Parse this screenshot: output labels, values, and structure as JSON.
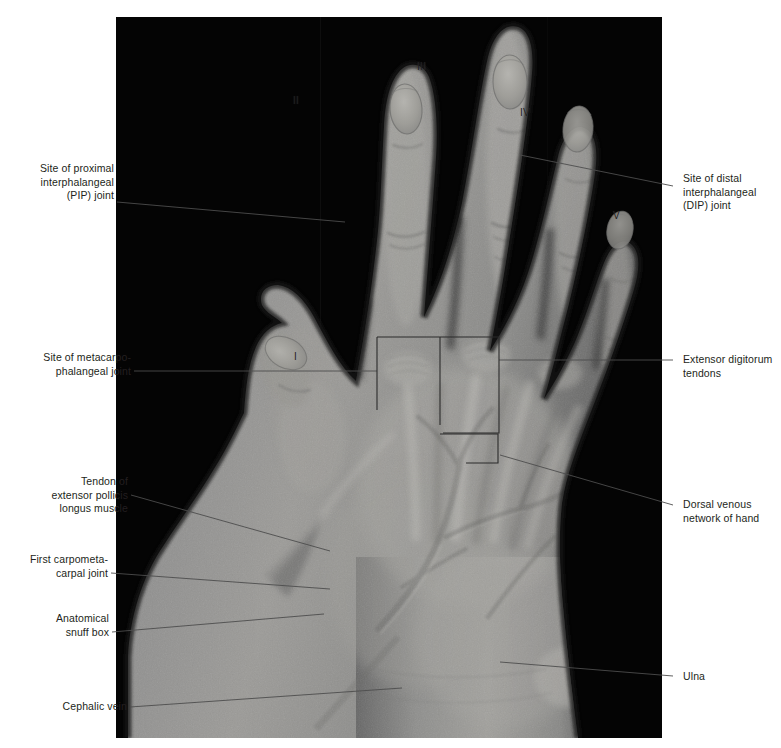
{
  "figure": {
    "background_color": "#ffffff",
    "plate_background_color": "#030303",
    "leader_line_color": "#4d4d4d",
    "label_text_color": "#231f20"
  },
  "labels_left": [
    {
      "name": "pip-joint",
      "text": "Site of proximal\ninterphalangeal\n(PIP) joint"
    },
    {
      "name": "mcp-joint",
      "text": "Site of metacarpo-\nphalangeal joint"
    },
    {
      "name": "epl-tendon",
      "text": "Tendon of\nextensor pollicis\nlongus muscle"
    },
    {
      "name": "first-cmc-joint",
      "text": "First carpometa-\ncarpal joint"
    },
    {
      "name": "snuff-box",
      "text": "Anatomical\nsnuff box"
    },
    {
      "name": "cephalic-vein",
      "text": "Cephalic vein"
    }
  ],
  "labels_right": [
    {
      "name": "dip-joint",
      "text": "Site of distal\ninterphalangeal\n(DIP) joint"
    },
    {
      "name": "extensor-digitorum-tendons",
      "text": "Extensor digitorum\ntendons"
    },
    {
      "name": "dorsal-venous-network",
      "text": "Dorsal venous\nnetwork of hand"
    },
    {
      "name": "ulna",
      "text": "Ulna"
    }
  ],
  "digit_labels": [
    {
      "name": "digit-1",
      "text": "I"
    },
    {
      "name": "digit-2",
      "text": "II"
    },
    {
      "name": "digit-3",
      "text": "III"
    },
    {
      "name": "digit-4",
      "text": "IV"
    },
    {
      "name": "digit-5",
      "text": "V"
    }
  ],
  "caption": {
    "text": ""
  }
}
